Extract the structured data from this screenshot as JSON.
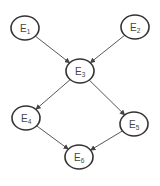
{
  "diagram": {
    "type": "directed-graph",
    "nodes": [
      {
        "id": "E1",
        "base": "E",
        "sub": "1",
        "cx": 25,
        "cy": 28
      },
      {
        "id": "E2",
        "base": "E",
        "sub": "2",
        "cx": 135,
        "cy": 27
      },
      {
        "id": "E3",
        "base": "E",
        "sub": "3",
        "cx": 80,
        "cy": 71
      },
      {
        "id": "E4",
        "base": "E",
        "sub": "4",
        "cx": 26,
        "cy": 118
      },
      {
        "id": "E5",
        "base": "E",
        "sub": "5",
        "cx": 134,
        "cy": 124
      },
      {
        "id": "E6",
        "base": "E",
        "sub": "6",
        "cx": 79,
        "cy": 157
      }
    ],
    "edges": [
      {
        "from": "E1",
        "to": "E3"
      },
      {
        "from": "E2",
        "to": "E3"
      },
      {
        "from": "E3",
        "to": "E4"
      },
      {
        "from": "E3",
        "to": "E5"
      },
      {
        "from": "E4",
        "to": "E6"
      },
      {
        "from": "E5",
        "to": "E6"
      }
    ],
    "colors": {
      "stroke": "#333333",
      "edge": "#444444",
      "text": "#444444",
      "background": "#ffffff"
    }
  }
}
